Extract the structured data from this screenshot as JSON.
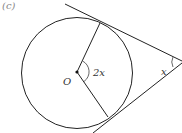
{
  "figure": {
    "part_label": "(c)",
    "center_label": "O",
    "center_angle_label": "2x",
    "external_angle_label": "x"
  },
  "colors": {
    "stroke": "#222222",
    "text": "#333333",
    "part_label": "#888888"
  }
}
